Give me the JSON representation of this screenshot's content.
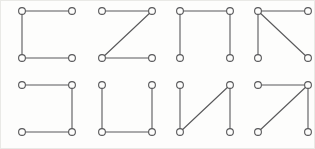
{
  "figure": {
    "width": 315,
    "height": 149,
    "background_color": "#fdfdfc",
    "border_color": "#e9e9e6",
    "node_color_stroke": "#58585a",
    "node_color_fill": "#fdfdfc",
    "edge_color": "#58585a",
    "node_radius": 3.4,
    "edge_width": 1.1,
    "grid_columns": 4,
    "grid_rows": 2
  },
  "layout": {
    "cell_width": 78,
    "cell_height": 74,
    "cell_origins": [
      {
        "x": 0,
        "y": 0
      },
      {
        "x": 80,
        "y": 0
      },
      {
        "x": 158,
        "y": 0
      },
      {
        "x": 236,
        "y": 0
      },
      {
        "x": 0,
        "y": 74
      },
      {
        "x": 80,
        "y": 74
      },
      {
        "x": 158,
        "y": 74
      },
      {
        "x": 236,
        "y": 74
      }
    ],
    "node_positions": {
      "top_left": {
        "x": 22,
        "y": 11
      },
      "top_right": {
        "x": 72,
        "y": 11
      },
      "bottom_left": {
        "x": 22,
        "y": 58
      },
      "bottom_right": {
        "x": 72,
        "y": 58
      }
    }
  },
  "graphs": [
    {
      "index": 1,
      "name": "graph-c-shape",
      "shape_label": "C",
      "description": "Open right side: top, left and bottom edges",
      "nodes": [
        "top_left",
        "top_right",
        "bottom_left",
        "bottom_right"
      ],
      "edges": [
        [
          "top_left",
          "top_right"
        ],
        [
          "top_left",
          "bottom_left"
        ],
        [
          "bottom_left",
          "bottom_right"
        ]
      ]
    },
    {
      "index": 2,
      "name": "graph-z-shape",
      "shape_label": "Z",
      "description": "Top edge, diagonal top-right to bottom-left, bottom edge",
      "nodes": [
        "top_left",
        "top_right",
        "bottom_left",
        "bottom_right"
      ],
      "edges": [
        [
          "top_left",
          "top_right"
        ],
        [
          "top_right",
          "bottom_left"
        ],
        [
          "bottom_left",
          "bottom_right"
        ]
      ]
    },
    {
      "index": 3,
      "name": "graph-pi-shape",
      "shape_label": "Π",
      "description": "Open bottom: top, left and right edges",
      "nodes": [
        "top_left",
        "top_right",
        "bottom_left",
        "bottom_right"
      ],
      "edges": [
        [
          "top_left",
          "top_right"
        ],
        [
          "top_left",
          "bottom_left"
        ],
        [
          "top_right",
          "bottom_right"
        ]
      ]
    },
    {
      "index": 4,
      "name": "graph-top-left-fan",
      "shape_label": "⊿",
      "description": "Top edge, left edge and diagonal top-left to bottom-right",
      "nodes": [
        "top_left",
        "top_right",
        "bottom_left",
        "bottom_right"
      ],
      "edges": [
        [
          "top_left",
          "top_right"
        ],
        [
          "top_left",
          "bottom_left"
        ],
        [
          "top_left",
          "bottom_right"
        ]
      ]
    },
    {
      "index": 5,
      "name": "graph-reverse-c-shape",
      "shape_label": "⊐",
      "description": "Open left side: top, right and bottom edges",
      "nodes": [
        "top_left",
        "top_right",
        "bottom_left",
        "bottom_right"
      ],
      "edges": [
        [
          "top_left",
          "top_right"
        ],
        [
          "top_right",
          "bottom_right"
        ],
        [
          "bottom_left",
          "bottom_right"
        ]
      ]
    },
    {
      "index": 6,
      "name": "graph-u-shape",
      "shape_label": "U",
      "description": "Open top: left, bottom and right edges",
      "nodes": [
        "top_left",
        "top_right",
        "bottom_left",
        "bottom_right"
      ],
      "edges": [
        [
          "top_left",
          "bottom_left"
        ],
        [
          "bottom_left",
          "bottom_right"
        ],
        [
          "top_right",
          "bottom_right"
        ]
      ]
    },
    {
      "index": 7,
      "name": "graph-n-shape",
      "shape_label": "N",
      "description": "Left edge, diagonal bottom-left to top-right, right edge",
      "nodes": [
        "top_left",
        "top_right",
        "bottom_left",
        "bottom_right"
      ],
      "edges": [
        [
          "top_left",
          "bottom_left"
        ],
        [
          "bottom_left",
          "top_right"
        ],
        [
          "top_right",
          "bottom_right"
        ]
      ]
    },
    {
      "index": 8,
      "name": "graph-seven-shape",
      "shape_label": "7",
      "description": "Top edge, right edge and diagonal top-right to bottom-left",
      "nodes": [
        "top_left",
        "top_right",
        "bottom_left",
        "bottom_right"
      ],
      "edges": [
        [
          "top_left",
          "top_right"
        ],
        [
          "top_right",
          "bottom_left"
        ],
        [
          "top_right",
          "bottom_right"
        ]
      ]
    }
  ]
}
